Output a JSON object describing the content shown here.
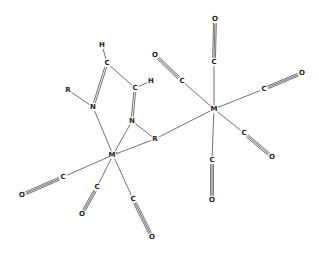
{
  "diagram": {
    "title": "",
    "colors": {
      "line": "#333333",
      "text": "#222222",
      "background": "#ffffff"
    },
    "atoms": [
      {
        "id": "M1",
        "label": "M",
        "x": 214,
        "y": 109
      },
      {
        "id": "M2",
        "label": "M'",
        "x": 113,
        "y": 155
      },
      {
        "id": "H1",
        "label": "H",
        "x": 102,
        "y": 45
      },
      {
        "id": "C1",
        "label": "C",
        "x": 107,
        "y": 63
      },
      {
        "id": "H2",
        "label": "H",
        "x": 151,
        "y": 81
      },
      {
        "id": "C2",
        "label": "C",
        "x": 135,
        "y": 88
      },
      {
        "id": "R1",
        "label": "R",
        "x": 68,
        "y": 90
      },
      {
        "id": "N1",
        "label": "N",
        "x": 93,
        "y": 107
      },
      {
        "id": "N2",
        "label": "N",
        "x": 132,
        "y": 121
      },
      {
        "id": "R2",
        "label": "R",
        "x": 155,
        "y": 139
      },
      {
        "id": "Ca",
        "label": "C",
        "x": 214,
        "y": 62
      },
      {
        "id": "Oa",
        "label": "O",
        "x": 215,
        "y": 19
      },
      {
        "id": "Cb",
        "label": "C",
        "x": 182,
        "y": 81
      },
      {
        "id": "Ob",
        "label": "O",
        "x": 155,
        "y": 55
      },
      {
        "id": "Cc",
        "label": "C",
        "x": 264,
        "y": 89
      },
      {
        "id": "Oc",
        "label": "O",
        "x": 302,
        "y": 73
      },
      {
        "id": "Cd",
        "label": "C",
        "x": 244,
        "y": 133
      },
      {
        "id": "Od",
        "label": "O",
        "x": 272,
        "y": 157
      },
      {
        "id": "Ce",
        "label": "C",
        "x": 212,
        "y": 160
      },
      {
        "id": "Oe",
        "label": "O",
        "x": 212,
        "y": 200
      },
      {
        "id": "Cf",
        "label": "C",
        "x": 63,
        "y": 177
      },
      {
        "id": "Of",
        "label": "O",
        "x": 22,
        "y": 195
      },
      {
        "id": "Cg",
        "label": "C",
        "x": 97,
        "y": 187
      },
      {
        "id": "Og",
        "label": "O",
        "x": 82,
        "y": 214
      },
      {
        "id": "Ch",
        "label": "C",
        "x": 133,
        "y": 199
      },
      {
        "id": "Oh",
        "label": "O",
        "x": 152,
        "y": 237
      }
    ],
    "bonds": [
      {
        "a": "H1",
        "b": "C1",
        "order": 1
      },
      {
        "a": "C1",
        "b": "C2",
        "order": 1
      },
      {
        "a": "C2",
        "b": "H2",
        "order": 1
      },
      {
        "a": "C1",
        "b": "N1",
        "order": 2
      },
      {
        "a": "C2",
        "b": "N2",
        "order": 2
      },
      {
        "a": "R1",
        "b": "N1",
        "order": 1
      },
      {
        "a": "N2",
        "b": "R2",
        "order": 1
      },
      {
        "a": "N1",
        "b": "M2",
        "order": 1
      },
      {
        "a": "N2",
        "b": "M2",
        "order": 1
      },
      {
        "a": "M2",
        "b": "R2",
        "order": 1
      },
      {
        "a": "R2",
        "b": "M1",
        "order": 1
      },
      {
        "a": "M1",
        "b": "Ca",
        "order": 1
      },
      {
        "a": "Ca",
        "b": "Oa",
        "order": 3
      },
      {
        "a": "M1",
        "b": "Cb",
        "order": 1
      },
      {
        "a": "Cb",
        "b": "Ob",
        "order": 3
      },
      {
        "a": "M1",
        "b": "Cc",
        "order": 1
      },
      {
        "a": "Cc",
        "b": "Oc",
        "order": 3
      },
      {
        "a": "M1",
        "b": "Cd",
        "order": 1
      },
      {
        "a": "Cd",
        "b": "Od",
        "order": 3
      },
      {
        "a": "M1",
        "b": "Ce",
        "order": 1
      },
      {
        "a": "Ce",
        "b": "Oe",
        "order": 3
      },
      {
        "a": "M2",
        "b": "Cf",
        "order": 1
      },
      {
        "a": "Cf",
        "b": "Of",
        "order": 3
      },
      {
        "a": "M2",
        "b": "Cg",
        "order": 1
      },
      {
        "a": "Cg",
        "b": "Og",
        "order": 3
      },
      {
        "a": "M2",
        "b": "Ch",
        "order": 1
      },
      {
        "a": "Ch",
        "b": "Oh",
        "order": 3
      }
    ]
  }
}
